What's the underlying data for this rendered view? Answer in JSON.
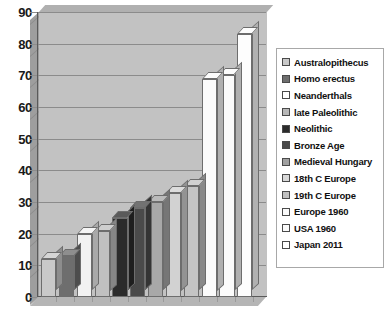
{
  "chart_data": {
    "type": "bar",
    "title": "",
    "xlabel": "",
    "ylabel": "",
    "ylim": [
      0,
      90
    ],
    "ytick_step": 10,
    "yticks": [
      "0",
      "10",
      "20",
      "30",
      "40",
      "50",
      "60",
      "70",
      "80",
      "90"
    ],
    "grid": true,
    "legend_position": "right",
    "categories": [
      "Australopithecus",
      "Homo erectus",
      "Neanderthals",
      "late Paleolithic",
      "Neolithic",
      "Bronze Age",
      "Medieval Hungary",
      "18th C Europe",
      "19th C Europe",
      "Europe 1960",
      "USA 1960",
      "Japan 2011"
    ],
    "values": [
      12,
      13,
      20,
      21,
      25,
      28,
      30,
      33,
      35,
      69,
      70,
      83
    ],
    "series": [
      {
        "name": "Life expectancy",
        "values": [
          12,
          13,
          20,
          21,
          25,
          28,
          30,
          33,
          35,
          69,
          70,
          83
        ]
      }
    ],
    "bar_colors": [
      "#c9c9c9",
      "#6e6e6e",
      "#f2f2f2",
      "#c0c0c0",
      "#2b2b2b",
      "#4a4a4a",
      "#a8a8a8",
      "#d2d2d2",
      "#c4c4c4",
      "#fbfbfb",
      "#fbfbfb",
      "#fdfdfd"
    ]
  },
  "legend": {
    "items": [
      {
        "label": "Australopithecus",
        "color": "#c9c9c9"
      },
      {
        "label": "Homo erectus",
        "color": "#6e6e6e"
      },
      {
        "label": "Neanderthals",
        "color": "#ffffff"
      },
      {
        "label": "late Paleolithic",
        "color": "#b8b8b8"
      },
      {
        "label": "Neolithic",
        "color": "#2b2b2b"
      },
      {
        "label": "Bronze Age",
        "color": "#4a4a4a"
      },
      {
        "label": "Medieval Hungary",
        "color": "#a0a0a0"
      },
      {
        "label": "18th C Europe",
        "color": "#d8d8d8"
      },
      {
        "label": "19th C Europe",
        "color": "#c0c0c0"
      },
      {
        "label": "Europe 1960",
        "color": "#fafafa"
      },
      {
        "label": "USA 1960",
        "color": "#fafafa"
      },
      {
        "label": "Japan 2011",
        "color": "#ffffff"
      }
    ]
  },
  "colors": {
    "plot_background": "#c2c2c2",
    "gridline": "#8b8b8b",
    "axis": "#5a5a5a",
    "tick_label": "#1a1a1a",
    "legend_border": "#a8a8a8",
    "legend_background": "#ffffff"
  }
}
